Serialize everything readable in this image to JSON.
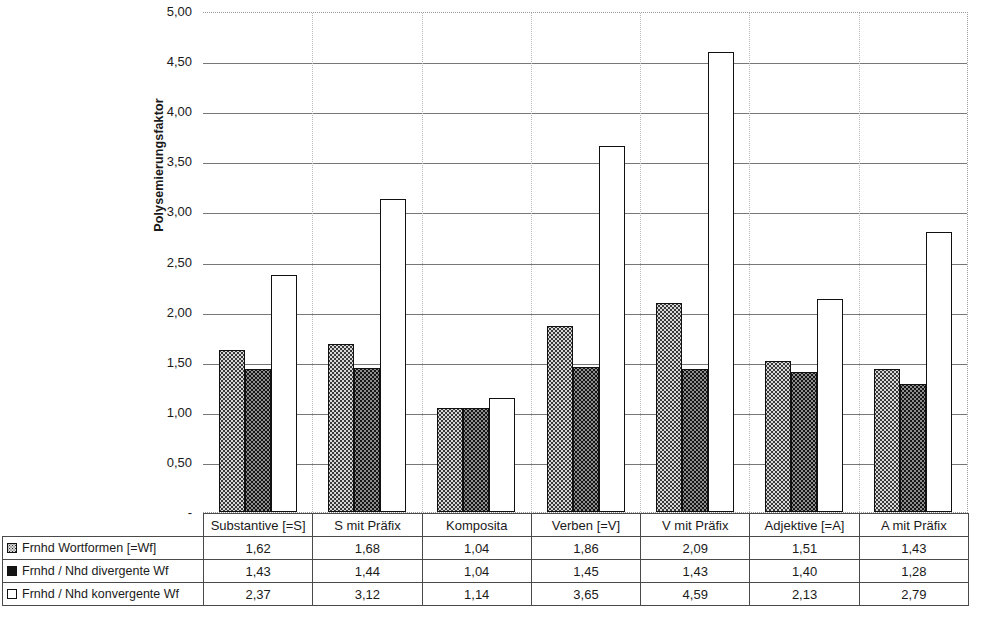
{
  "chart_data": {
    "type": "bar",
    "title": "",
    "subtitle": "",
    "xlabel": "",
    "ylabel": "Polysemierungsfaktor",
    "ylim": [
      0,
      5.0
    ],
    "ytick_step": 0.5,
    "ytick_labels": [
      "5,00",
      "4,50",
      "4,00",
      "3,50",
      "3,00",
      "2,50",
      "2,00",
      "1,50",
      "1,00",
      "0,50",
      "-"
    ],
    "ytick_values": [
      5.0,
      4.5,
      4.0,
      3.5,
      3.0,
      2.5,
      2.0,
      1.5,
      1.0,
      0.5,
      0.0
    ],
    "grid": true,
    "grid_axis": "y",
    "legend_position": "data-table",
    "categories": [
      "Substantive [=S]",
      "S mit Präfix",
      "Komposita",
      "Verben [=V]",
      "V mit Präfix",
      "Adjektive [=A]",
      "A mit Präfix"
    ],
    "series": [
      {
        "name": "Frnhd Wortformen [=Wf]",
        "fill": "light-dotted",
        "values": [
          1.62,
          1.68,
          1.04,
          1.86,
          2.09,
          1.51,
          1.43
        ],
        "labels": [
          "1,62",
          "1,68",
          "1,04",
          "1,86",
          "2,09",
          "1,51",
          "1,43"
        ]
      },
      {
        "name": "Frnhd / Nhd divergente Wf",
        "fill": "dark-dotted",
        "values": [
          1.43,
          1.44,
          1.04,
          1.45,
          1.43,
          1.4,
          1.28
        ],
        "labels": [
          "1,43",
          "1,44",
          "1,04",
          "1,45",
          "1,43",
          "1,40",
          "1,28"
        ]
      },
      {
        "name": "Frnhd / Nhd konvergente Wf",
        "fill": "white",
        "values": [
          2.37,
          3.12,
          1.14,
          3.65,
          4.59,
          2.13,
          2.79
        ],
        "labels": [
          "2,37",
          "3,12",
          "1,14",
          "3,65",
          "4,59",
          "2,13",
          "2,79"
        ]
      }
    ]
  },
  "table": {
    "corner_label": "",
    "column_headers": [
      "Substantive [=S]",
      "S mit Präfix",
      "Komposita",
      "Verben [=V]",
      "V mit Präfix",
      "Adjektive [=A]",
      "A mit Präfix"
    ],
    "rows": [
      {
        "legend": "Frnhd Wortformen [=Wf]",
        "swatch": "light-dotted-square-icon",
        "values": [
          "1,62",
          "1,68",
          "1,04",
          "1,86",
          "2,09",
          "1,51",
          "1,43"
        ]
      },
      {
        "legend": "Frnhd / Nhd divergente Wf",
        "swatch": "dark-filled-square-icon",
        "values": [
          "1,43",
          "1,44",
          "1,04",
          "1,45",
          "1,43",
          "1,40",
          "1,28"
        ]
      },
      {
        "legend": "Frnhd / Nhd konvergente Wf",
        "swatch": "white-square-icon",
        "values": [
          "2,37",
          "3,12",
          "1,14",
          "3,65",
          "4,59",
          "2,13",
          "2,79"
        ]
      }
    ]
  },
  "colors": {
    "series_light": "#d8d8d8",
    "series_dark": "#151515",
    "series_white": "#ffffff",
    "gridline": "#777777",
    "axis": "#6d6d6d",
    "plot_border": "#9a9a9a",
    "table_border": "#4a4a4a",
    "text": "#1a1a1a"
  }
}
